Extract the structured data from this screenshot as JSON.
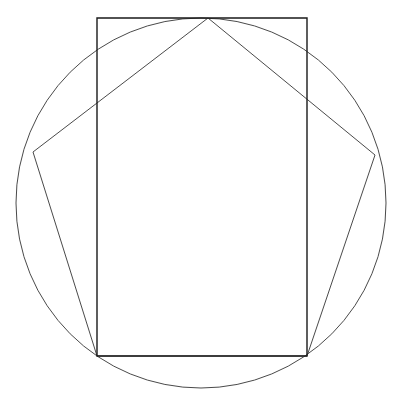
{
  "canvas": {
    "width": 404,
    "height": 416,
    "background_color": "#ffffff",
    "description": "Line drawing: circle with an inscribed rectangle and an inscribed pentagon sharing the rectangle's bottom corners"
  },
  "chart_data": {
    "type": "diagram",
    "title": "",
    "xlabel": "",
    "ylabel": "",
    "grid": false,
    "legend": "none",
    "xlim": [
      0,
      404
    ],
    "ylim": [
      0,
      416
    ],
    "shapes": [
      {
        "name": "circle",
        "kind": "circle",
        "center_x": 201,
        "center_y": 203,
        "radius": 185,
        "stroke_color": "#4a4a4a",
        "stroke_width": 1,
        "fill": "none"
      },
      {
        "name": "rectangle",
        "kind": "polygon",
        "closed": true,
        "points": [
          [
            97,
            18
          ],
          [
            307,
            18
          ],
          [
            307,
            356
          ],
          [
            97,
            356
          ]
        ],
        "stroke_color": "#1a1a1a",
        "stroke_width": 1.4,
        "fill": "none"
      },
      {
        "name": "pentagon",
        "kind": "polygon",
        "closed": true,
        "points": [
          [
            208,
            18
          ],
          [
            375,
            155
          ],
          [
            307,
            356
          ],
          [
            97,
            356
          ],
          [
            33,
            152
          ]
        ],
        "stroke_color": "#4a4a4a",
        "stroke_width": 1,
        "fill": "none"
      }
    ],
    "measurements": {
      "circle_diameter": 370,
      "circle_left_x": 16,
      "circle_right_x": 386,
      "circle_top_y": 18,
      "circle_bottom_y": 388,
      "rectangle_width": 210,
      "rectangle_height": 338,
      "rectangle_top_y": 18,
      "rectangle_bottom_y": 356,
      "rectangle_left_x": 97,
      "rectangle_right_x": 307,
      "pentagon_apex_x": 208,
      "pentagon_apex_y": 18,
      "pentagon_left_vertex_x": 33,
      "pentagon_left_vertex_y": 152,
      "pentagon_right_vertex_x": 375,
      "pentagon_right_vertex_y": 155
    }
  },
  "colors": {
    "background": "#ffffff",
    "circle_stroke": "#4a4a4a",
    "rectangle_stroke": "#1a1a1a",
    "pentagon_stroke": "#4a4a4a"
  },
  "labels": {
    "figure_caption": ""
  }
}
